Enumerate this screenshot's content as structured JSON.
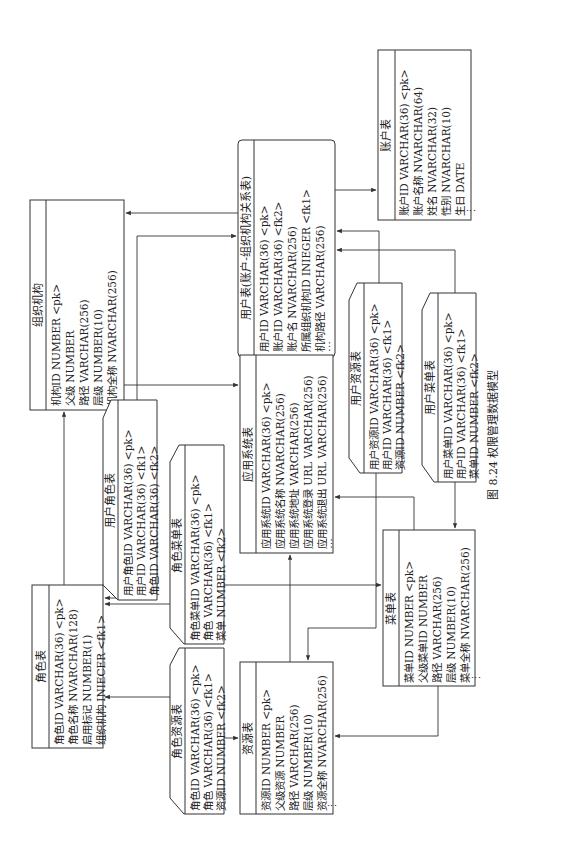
{
  "caption": "图 8.24   权限管理数据模型",
  "tables": {
    "account": {
      "title": "账户表",
      "rows": [
        "账户ID  VARCHAR(36)    <pk>",
        "账户名称  NVARCHAR(64)",
        "姓名  NVARCHAR(32)",
        "性别  NVARCHAR(10)",
        "生日  DATE",
        "⋮"
      ]
    },
    "user": {
      "title": "用户表(账户-组织机构关系表)",
      "rows": [
        "用户ID  VARCHAR(36)    <pk>",
        "账户ID  VARCHAR(36)    <fk2>",
        "账户名  NVARCHAR(256)",
        "所属组织机构ID  INIEGER    <fk1>",
        "机构路径  VARCHAR(256)",
        "⋯"
      ]
    },
    "org": {
      "title": "组织机构",
      "rows": [
        "机构ID  NUMBER       <pk>",
        "父级  NUMBER",
        "路径  VARCHAR(256)",
        "层级  NUMBER(10)",
        "机构全称  NVARCHAR(256)",
        "⋮"
      ]
    },
    "app": {
      "title": "应用系统表",
      "rows": [
        "应用系统ID  VARCHAR(36)     <pk>",
        "应用系统名称  NVARCHAR(256)",
        "应用系统地址  VARCHAR(256)",
        "应用系统登录  URL  VARCHAR(256)",
        "应用系统退出  URL  VARCHAR(256)",
        "⋯"
      ]
    },
    "user_resource": {
      "title": "用户资源表",
      "rows": [
        "用户资源ID  VARCHAR(36)  <pk>",
        "用户ID  VARCHAR(36)  <fk1>",
        "资源ID  NUMBER  <fk2>"
      ]
    },
    "user_menu": {
      "title": "用户菜单表",
      "rows": [
        "用户菜单ID  VARCHAR(36)  <pk>",
        "用户ID  VARCHAR(36)  <fk1>",
        "菜单ID  NUMBER  <fk2>"
      ]
    },
    "user_role": {
      "title": "用户角色表",
      "rows": [
        "用户角色ID  VARCHAR(36)  <pk>",
        "用户ID  VARCHAR(36)  <fk1>",
        "角色ID  VARCHAR(36)  <fk2>"
      ]
    },
    "role_menu": {
      "title": "角色菜单表",
      "rows": [
        "角色菜单ID  VARCHAR(36)  <pk>",
        "角色  VARCHAR(36)  <fk1>",
        "菜单  NUMBER  <fk2>"
      ]
    },
    "menu": {
      "title": "菜单表",
      "rows": [
        "菜单ID  NUMBER       <pk>",
        "父级菜单ID  NUMBER",
        "路径  VARCHAR(256)",
        "层级  NUMBER(10)",
        "菜单全称  NVARCHAR(256)",
        "⋮"
      ]
    },
    "role": {
      "title": "角色表",
      "rows": [
        "角色ID  VARCHAR(36)  <pk>",
        "角色名称  NVARCHAR(128)",
        "启用标记  NUMBER(1)",
        "组织机构  INIECER    <fk1>"
      ]
    },
    "role_resource": {
      "title": "角色资源表",
      "rows": [
        "角色ID  VARCHAR(36)  <pk>",
        "角色  VARCHAR(36)  <fk1>",
        "资源ID  NUMBER  <fk2>"
      ]
    },
    "resource": {
      "title": "资源表",
      "rows": [
        "资源ID  NUMBER       <pk>",
        "父级资源  NUMBER",
        "路径  VARCHAR(256)",
        "层级  NUMBER(10)",
        "资源全称  NVARCHAR(256)",
        "⋮"
      ]
    }
  }
}
